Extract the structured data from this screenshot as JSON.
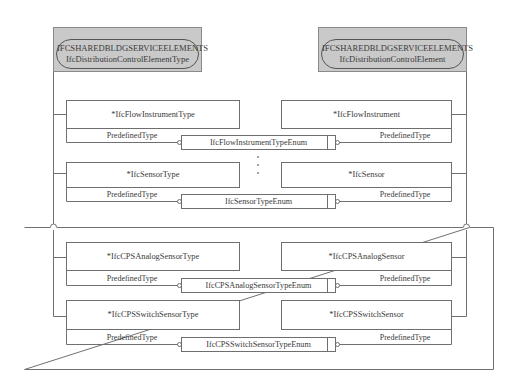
{
  "diagram": {
    "headers": [
      {
        "schema": "IFCSHAREDBLDGSERVICEELEMENTS",
        "entity": "IfcDistributionControlElementType"
      },
      {
        "schema": "IFCSHAREDBLDGSERVICEELEMENTS",
        "entity": "IfcDistributionControlElement"
      }
    ],
    "rows": [
      {
        "type_entity": "*IfcFlowInstrumentType",
        "occurrence_entity": "*IfcFlowInstrument",
        "left_attr": "PredefinedType",
        "right_attr": "PredefinedType",
        "enum": "IfcFlowInstrumentTypeEnum"
      },
      {
        "type_entity": "*IfcSensorType",
        "occurrence_entity": "*IfcSensor",
        "left_attr": "PredefinedType",
        "right_attr": "PredefinedType",
        "enum": "IfcSensorTypeEnum"
      },
      {
        "type_entity": "*IfcCPSAnalogSensorType",
        "occurrence_entity": "*IfcCPSAnalogSensor",
        "left_attr": "PredefinedType",
        "right_attr": "PredefinedType",
        "enum": "IfcCPSAnalogSensorTypeEnum"
      },
      {
        "type_entity": "*IfcCPSSwitchSensorType",
        "occurrence_entity": "*IfcCPSSwitchSensor",
        "left_attr": "PredefinedType",
        "right_attr": "PredefinedType",
        "enum": "IfcCPSSwitchSensorTypeEnum"
      }
    ],
    "ellipsis": "⋮",
    "colors": {
      "header_fill": "#c9c9c9",
      "line": "#6e6e6e",
      "text": "#3a3a3a"
    }
  }
}
